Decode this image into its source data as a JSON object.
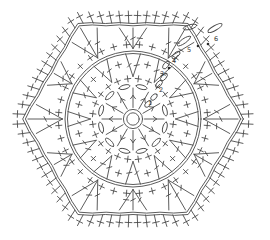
{
  "app": {
    "name": "crochet-hexagon-motif-chart"
  },
  "colors": {
    "background": "#ffffff",
    "line": "#4a4a4a",
    "label": "#333333",
    "dot": "#2b2b2b"
  },
  "canvas": {
    "width": 270,
    "height": 240,
    "cx": 133,
    "cy": 119
  },
  "center_ring": {
    "inner_r": 6.2,
    "outer_r": 9.6
  },
  "rounds": {
    "r1_dc_spokes": {
      "count": 12,
      "start_angle": 0,
      "step": 30,
      "inner": 11.5,
      "outer": 31,
      "arrow_at": 0.62
    },
    "r1_chain_ovals": {
      "radius": 33,
      "rx": 5.6,
      "ry": 2.1,
      "angles": [
        15,
        75,
        105,
        135,
        165,
        195,
        225,
        255,
        285,
        315,
        345
      ]
    },
    "r2_sc": {
      "count": 24,
      "radius": 40.5,
      "start_angle": 7.5,
      "step": 15,
      "arm": 3.1
    },
    "r3_dc_pairs": {
      "count": 12,
      "step": 30,
      "base_radius": 42.5,
      "tip_radius": 65.5,
      "spread_deg": 6.5
    },
    "r3_sc": {
      "radius": 56,
      "arm": 3.1,
      "angles": [
        15,
        75,
        105,
        135,
        165,
        195,
        225,
        255,
        285,
        315,
        345
      ]
    },
    "arc1_chain_circle": {
      "inner_r": 65.5,
      "outer_r": 68,
      "scallops": 12,
      "bump": 2
    },
    "r4_sc": {
      "count": 36,
      "radius": 74.5,
      "start_angle": 5,
      "step": 10,
      "arm": 3.1
    },
    "r5_dc_fans": {
      "count": 12,
      "step": 30,
      "base_radius": 70.5,
      "tip_apothem": 91,
      "spread_deg": 8.5
    },
    "edge_chain": {
      "apothem_outer": 95.5,
      "apothem_inner": 93.2,
      "scallops_per_edge": 4,
      "bump": 1.8
    },
    "r6_sc": {
      "count": 72,
      "start_angle": 2.5,
      "step": 5,
      "stem": 12,
      "cross_at": 7.5,
      "arm": 3.4
    }
  },
  "seam_chains": [
    {
      "x": 148,
      "y": 104,
      "len": 8,
      "rot": -45
    },
    {
      "x": 154,
      "y": 97,
      "len": 8,
      "rot": -45
    },
    {
      "x": 159,
      "y": 84,
      "len": 9,
      "rot": -50
    },
    {
      "x": 164,
      "y": 77,
      "len": 9,
      "rot": -50
    },
    {
      "x": 166,
      "y": 65,
      "len": 9,
      "rot": -55
    },
    {
      "x": 176,
      "y": 55,
      "len": 10,
      "rot": -40
    },
    {
      "x": 184,
      "y": 41,
      "len": 16,
      "rot": -35
    },
    {
      "x": 190,
      "y": 27,
      "len": 14,
      "rot": -15
    },
    {
      "x": 215,
      "y": 28,
      "len": 16,
      "rot": -30
    }
  ],
  "round_labels": [
    {
      "text": "1",
      "x": 150,
      "y": 103
    },
    {
      "text": "2",
      "x": 161,
      "y": 90
    },
    {
      "text": "3",
      "x": 162,
      "y": 74
    },
    {
      "text": "4",
      "x": 174,
      "y": 61
    },
    {
      "text": "5",
      "x": 189,
      "y": 50
    },
    {
      "text": "6",
      "x": 216,
      "y": 39
    }
  ],
  "slip_stitch_dots": [
    {
      "x": 169,
      "y": 68
    },
    {
      "x": 198,
      "y": 46
    },
    {
      "x": 208,
      "y": 44
    }
  ]
}
